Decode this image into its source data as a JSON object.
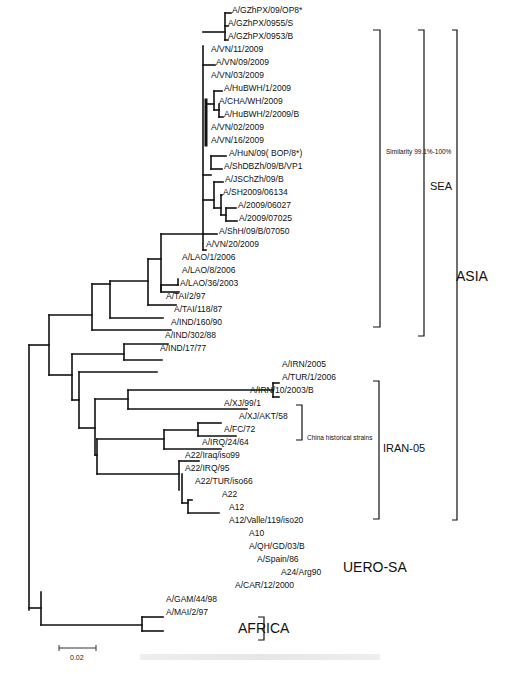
{
  "figure": {
    "type": "phylogenetic-tree",
    "scale_bar": "0.02",
    "caption": ""
  },
  "taxa": [
    {
      "label": "A/GZhPX/09/OP8*",
      "x": 232,
      "y": 10
    },
    {
      "label": "A/GZhPX/0955/S",
      "x": 228,
      "y": 23
    },
    {
      "label": "A/GZhPX/0953/B",
      "x": 228,
      "y": 36
    },
    {
      "label": "A/VN/11/2009",
      "x": 211,
      "y": 49
    },
    {
      "label": "A/VN/09/2009",
      "x": 216,
      "y": 62
    },
    {
      "label": "A/VN/03/2009",
      "x": 211,
      "y": 75
    },
    {
      "label": "A/HuBWH/1/2009",
      "x": 224,
      "y": 88
    },
    {
      "label": "A/CHA/WH/2009",
      "x": 219,
      "y": 101
    },
    {
      "label": "A/HuBWH/2/2009/B",
      "x": 224,
      "y": 114
    },
    {
      "label": "A/VN/02/2009",
      "x": 211,
      "y": 127
    },
    {
      "label": "A/VN/16/2009",
      "x": 211,
      "y": 140
    },
    {
      "label": "A/HuN/09(  BOP/8*)",
      "x": 229,
      "y": 153
    },
    {
      "label": "A/ShDBZh/09/B/VP1",
      "x": 224,
      "y": 166
    },
    {
      "label": "A/JSChZh/09/B",
      "x": 225,
      "y": 179
    },
    {
      "label": "A/SH2009/06134",
      "x": 223,
      "y": 192
    },
    {
      "label": "A/2009/06027",
      "x": 238,
      "y": 205
    },
    {
      "label": "A/2009/07025",
      "x": 239,
      "y": 218
    },
    {
      "label": "A/ShH/09/B/07050",
      "x": 219,
      "y": 231
    },
    {
      "label": "A/VN/20/2009",
      "x": 206,
      "y": 244
    },
    {
      "label": "A/LAO/1/2006",
      "x": 182,
      "y": 257
    },
    {
      "label": "A/LAO/8/2006",
      "x": 182,
      "y": 270
    },
    {
      "label": "A/LAO/36/2003",
      "x": 180,
      "y": 283
    },
    {
      "label": "A/TAI/2/97",
      "x": 166,
      "y": 296
    },
    {
      "label": "A/TAI/118/87",
      "x": 174,
      "y": 309
    },
    {
      "label": "A/IND/160/90",
      "x": 171,
      "y": 322
    },
    {
      "label": "A/IND/302/88",
      "x": 165,
      "y": 335
    },
    {
      "label": "A/IND/17/77",
      "x": 160,
      "y": 348
    },
    {
      "label": "A/IRN/2005",
      "x": 282,
      "y": 364
    },
    {
      "label": "A/TUR/1/2006",
      "x": 282,
      "y": 377
    },
    {
      "label": "A/IRN/10/2003/B",
      "x": 250,
      "y": 390
    },
    {
      "label": "A/XJ/99/1",
      "x": 224,
      "y": 403
    },
    {
      "label": "A/XJ/AKT/58",
      "x": 239,
      "y": 416
    },
    {
      "label": "A/FC/72",
      "x": 224,
      "y": 429
    },
    {
      "label": "A/IRQ/24/64",
      "x": 202,
      "y": 442
    },
    {
      "label": "A22/Iraq/iso99",
      "x": 185,
      "y": 455
    },
    {
      "label": "A22/IRQ/95",
      "x": 185,
      "y": 468
    },
    {
      "label": "A22/TUR/iso66",
      "x": 195,
      "y": 481
    },
    {
      "label": "A22",
      "x": 222,
      "y": 494
    },
    {
      "label": "A12",
      "x": 229,
      "y": 507
    },
    {
      "label": "A12/Valle/119/iso20",
      "x": 229,
      "y": 520
    },
    {
      "label": "A10",
      "x": 249,
      "y": 533
    },
    {
      "label": "A/QH/GD/03/B",
      "x": 249,
      "y": 546
    },
    {
      "label": "A/Spain/86",
      "x": 257,
      "y": 559
    },
    {
      "label": "A24/Arg90",
      "x": 281,
      "y": 572
    },
    {
      "label": "A/CAR/12/2000",
      "x": 235,
      "y": 585
    },
    {
      "label": "A/GAM/44/98",
      "x": 166,
      "y": 599
    },
    {
      "label": "A/MAI/2/97",
      "x": 166,
      "y": 612
    }
  ],
  "annotations": {
    "similarity": "Similarity 99.1%-100%",
    "china_historical": "China historical strains"
  },
  "groups": {
    "sea": "SEA",
    "asia": "ASIA",
    "iran05": "IRAN-05",
    "uero_sa": "UERO-SA",
    "africa": "AFRICA"
  }
}
